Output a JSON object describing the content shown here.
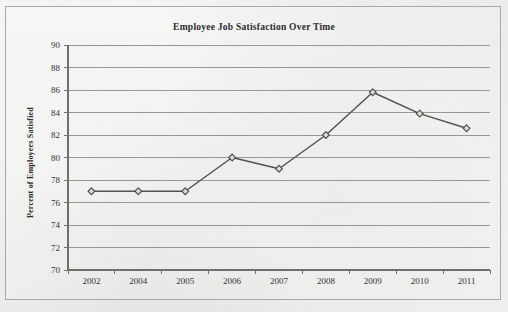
{
  "chart_data": {
    "type": "line",
    "title": "Employee Job Satisfaction Over Time",
    "xlabel": "",
    "ylabel": "Percent of Employees Satisfied",
    "categories": [
      "2002",
      "2004",
      "2005",
      "2006",
      "2007",
      "2008",
      "2009",
      "2010",
      "2011"
    ],
    "values": [
      77,
      77,
      77,
      80,
      79,
      82,
      85.8,
      83.9,
      82.6
    ],
    "ylim": [
      70,
      90
    ],
    "yticks": [
      70,
      72,
      74,
      76,
      78,
      80,
      82,
      84,
      86,
      88,
      90
    ],
    "ytick_labels": [
      "70",
      "72",
      "74",
      "76",
      "78",
      "80",
      "82",
      "84",
      "86",
      "88",
      "90"
    ],
    "grid": true,
    "grid_axis": "y",
    "legend": false,
    "legend_position": "none",
    "marker": "diamond",
    "series": [
      {
        "name": "Percent of Employees Satisfied",
        "values": [
          77,
          77,
          77,
          80,
          79,
          82,
          85.8,
          83.9,
          82.6
        ]
      }
    ],
    "colors": {
      "line": "#55524f",
      "marker_fill": "#dedcd8",
      "marker_edge": "#4e4b48",
      "grid": "#8d8d8a",
      "axis": "#6f6f6c",
      "text": "#2c2c2c",
      "background": "#e9e9e7"
    }
  }
}
